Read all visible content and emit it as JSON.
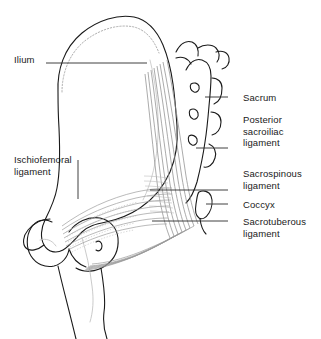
{
  "figure": {
    "background_color": "#ffffff",
    "bone_outline_color": "#1a1a1a",
    "ligament_fiber_color": "#8a8a8a",
    "leader_line_color": "#2b2b2b",
    "text_color": "#1a1a1a"
  },
  "labels": [
    {
      "id": "ilium",
      "text": "Ilium",
      "side": "left",
      "x": 14,
      "y": 54,
      "leader": {
        "x1": 46,
        "y1": 63,
        "x2": 147,
        "y2": 63
      }
    },
    {
      "id": "ischiofemoral-ligament",
      "text": "Ischiofemoral\nligament",
      "side": "left",
      "x": 14,
      "y": 154,
      "leader": {
        "x1": 78,
        "y1": 160,
        "x2": 78,
        "y2": 199
      }
    },
    {
      "id": "sacrum",
      "text": "Sacrum",
      "side": "right",
      "x": 243,
      "y": 92,
      "leader": {
        "x1": 228,
        "y1": 97,
        "x2": 205,
        "y2": 97
      }
    },
    {
      "id": "posterior-sacroiliac-ligament",
      "text": "Posterior\nsacroiliac\nligament",
      "side": "right",
      "x": 243,
      "y": 114,
      "leader": {
        "x1": 228,
        "y1": 148,
        "x2": 196,
        "y2": 148
      }
    },
    {
      "id": "sacrospinous-ligament",
      "text": "Sacrospinous\nligament",
      "side": "right",
      "x": 243,
      "y": 168,
      "leader": {
        "x1": 228,
        "y1": 190,
        "x2": 150,
        "y2": 190
      }
    },
    {
      "id": "coccyx",
      "text": "Coccyx",
      "side": "right",
      "x": 243,
      "y": 199,
      "leader": {
        "x1": 228,
        "y1": 204,
        "x2": 206,
        "y2": 204
      }
    },
    {
      "id": "sacrotuberous-ligament",
      "text": "Sacrotuberous\nligament",
      "side": "right",
      "x": 243,
      "y": 216,
      "leader": {
        "x1": 228,
        "y1": 221,
        "x2": 152,
        "y2": 221
      }
    }
  ],
  "structures": [
    {
      "id": "ilium-body",
      "name": "ilium"
    },
    {
      "id": "iliac-crest",
      "name": "iliac crest"
    },
    {
      "id": "sacrum-body",
      "name": "sacrum"
    },
    {
      "id": "sacral-foramina",
      "name": "sacral foramina",
      "count": 3
    },
    {
      "id": "coccyx-body",
      "name": "coccyx"
    },
    {
      "id": "femur-head",
      "name": "femoral head"
    },
    {
      "id": "greater-trochanter",
      "name": "greater trochanter"
    },
    {
      "id": "femur-shaft",
      "name": "femoral shaft"
    },
    {
      "id": "ischium",
      "name": "ischium"
    },
    {
      "id": "ischiofemoral-fibers",
      "name": "ischiofemoral ligament fibers"
    },
    {
      "id": "posterior-sacroiliac-fibers",
      "name": "posterior sacroiliac ligament fibers"
    },
    {
      "id": "sacrotuberous-fibers",
      "name": "sacrotuberous ligament fibers"
    }
  ]
}
